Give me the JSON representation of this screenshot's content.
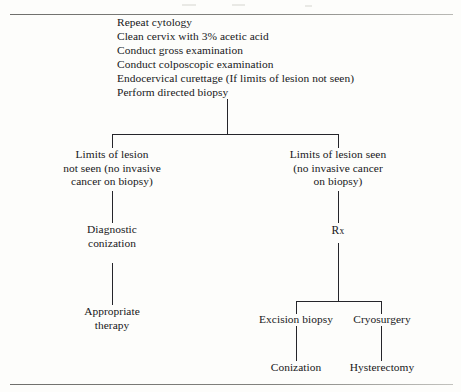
{
  "figure": {
    "type": "clinical-management-flowchart",
    "instructions": [
      "Repeat cytology",
      "Clean cervix with 3% acetic acid",
      "Conduct gross examination",
      "Conduct colposcopic examination",
      "Endocervical curettage (If limits of lesion not seen)",
      "Perform directed biopsy"
    ],
    "nodes": {
      "left_branch": {
        "lines": [
          "Limits of lesion",
          "not seen (no invasive",
          "cancer on biopsy)"
        ]
      },
      "right_branch": {
        "lines": [
          "Limits of lesion seen",
          "(no invasive cancer",
          "on biopsy)"
        ]
      },
      "diagnostic_conization": {
        "lines": [
          "Diagnostic",
          "conization"
        ]
      },
      "rx": {
        "lead": "R",
        "trail": "x"
      },
      "appropriate_therapy": {
        "lines": [
          "Appropriate",
          "therapy"
        ]
      },
      "excision_biopsy": {
        "lines": [
          "Excision biopsy"
        ]
      },
      "cryosurgery": {
        "lines": [
          "Cryosurgery"
        ]
      },
      "conization": {
        "lines": [
          "Conization"
        ]
      },
      "hysterectomy": {
        "lines": [
          "Hysterectomy"
        ]
      }
    },
    "colors": {
      "page": "#fdfdfb",
      "ink": "#17171a",
      "connector": "#25252a",
      "rule": "#83837f"
    }
  }
}
